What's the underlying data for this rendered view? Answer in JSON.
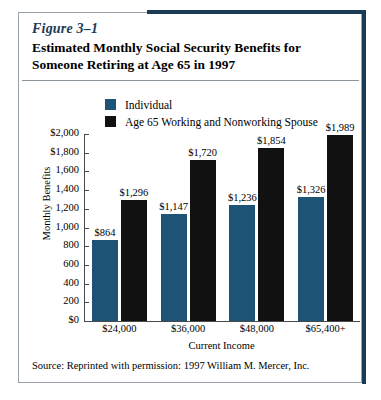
{
  "figure": {
    "number": "Figure 3–1",
    "title": "Estimated Monthly Social Security Benefits for Someone Retiring at Age 65 in 1997",
    "source": "Source:  Reprinted with permission:  1997 William M. Mercer, Inc."
  },
  "colors": {
    "individual": "#1d5475",
    "spouse": "#111111",
    "accent_border": "#1b3a54",
    "card_border": "#9aa3ab",
    "axis": "#4a4a4a"
  },
  "chart_data": {
    "type": "bar",
    "title": "Estimated Monthly Social Security Benefits for Someone Retiring at Age 65 in 1997",
    "xlabel": "Current Income",
    "ylabel": "Monthly Benefits",
    "categories": [
      "$24,000",
      "$36,000",
      "$48,000",
      "$65,400+"
    ],
    "series": [
      {
        "name": "Individual",
        "color": "#1d5475",
        "values": [
          864,
          1147,
          1236,
          1326
        ],
        "labels": [
          "$864",
          "$1,147",
          "$1,236",
          "$1,326"
        ]
      },
      {
        "name": "Age 65 Working and Nonworking Spouse",
        "color": "#111111",
        "values": [
          1296,
          1720,
          1854,
          1989
        ],
        "labels": [
          "$1,296",
          "$1,720",
          "$1,854",
          "$1,989"
        ]
      }
    ],
    "ylim": [
      0,
      2000
    ],
    "yticks": [
      0,
      200,
      400,
      600,
      800,
      1000,
      1200,
      1400,
      1600,
      1800,
      2000
    ],
    "ytick_labels": [
      "$0",
      "200",
      "400",
      "600",
      "800",
      "1,000",
      "1,200",
      "1,400",
      "1,600",
      "$1,800",
      "$2,000"
    ],
    "grid": false,
    "legend_position": "top"
  }
}
